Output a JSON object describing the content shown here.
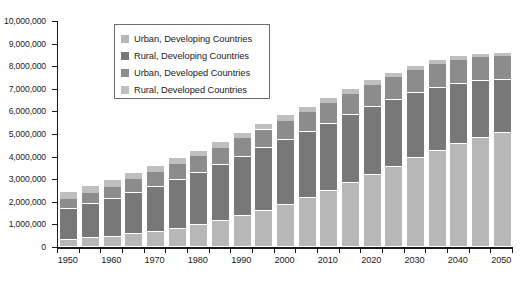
{
  "chart_data": {
    "type": "bar",
    "stacked": true,
    "title": "",
    "subtitle": "",
    "xlabel": "",
    "ylabel": "",
    "grid": false,
    "legend_position": "top-left-inside",
    "xlim": [
      "1950",
      "2050"
    ],
    "ylim": [
      0,
      10000000
    ],
    "ytick_step": 1000000,
    "categories": [
      "1950",
      "1955",
      "1960",
      "1965",
      "1970",
      "1975",
      "1980",
      "1985",
      "1990",
      "1995",
      "2000",
      "2005",
      "2010",
      "2015",
      "2020",
      "2025",
      "2030",
      "2035",
      "2040",
      "2045",
      "2050"
    ],
    "xtick_labels": [
      "1950",
      "1960",
      "1970",
      "1980",
      "1990",
      "2000",
      "2010",
      "2020",
      "2030",
      "2040",
      "2050"
    ],
    "ytick_labels": [
      "10,000,000",
      "9,000,000",
      "8,000,000",
      "7,000,000",
      "6,000,000",
      "5,000,000",
      "4,000,000",
      "3,000,000",
      "2,000,000",
      "1,000,000",
      "0"
    ],
    "series": [
      {
        "name": "Urban, Developing Countries",
        "color": "#b7b7b7",
        "values": [
          300000,
          380000,
          460000,
          570000,
          680000,
          810000,
          970000,
          1160000,
          1380000,
          1610000,
          1870000,
          2150000,
          2470000,
          2820000,
          3190000,
          3560000,
          3920000,
          4250000,
          4560000,
          4820000,
          5030000
        ]
      },
      {
        "name": "Rural, Developing Countries",
        "color": "#787878",
        "values": [
          1400000,
          1520000,
          1660000,
          1830000,
          1990000,
          2160000,
          2310000,
          2460000,
          2620000,
          2750000,
          2850000,
          2930000,
          2980000,
          3010000,
          3000000,
          2960000,
          2890000,
          2790000,
          2660000,
          2510000,
          2340000
        ]
      },
      {
        "name": "Urban, Developed Countries",
        "color": "#8c8c8c",
        "values": [
          440000,
          490000,
          540000,
          590000,
          640000,
          690000,
          730000,
          770000,
          810000,
          840000,
          870000,
          900000,
          930000,
          960000,
          990000,
          1010000,
          1030000,
          1050000,
          1060000,
          1070000,
          1080000
        ]
      },
      {
        "name": "Rural, Developed Countries",
        "color": "#bfbfbf",
        "values": [
          310000,
          300000,
          290000,
          280000,
          270000,
          260000,
          250000,
          245000,
          240000,
          235000,
          230000,
          225000,
          220000,
          210000,
          200000,
          190000,
          180000,
          170000,
          160000,
          150000,
          140000
        ]
      }
    ],
    "totals": [
      2450000,
      2690000,
      2950000,
      3270000,
      3580000,
      3920000,
      4260000,
      4635000,
      5050000,
      5435000,
      5820000,
      6205000,
      6600000,
      7000000,
      7380000,
      7720000,
      8020000,
      8260000,
      8440000,
      8550000,
      8590000
    ]
  },
  "legend": {
    "items": [
      {
        "label": "Urban, Developing Countries",
        "color": "#b7b7b7"
      },
      {
        "label": "Rural, Developing Countries",
        "color": "#787878"
      },
      {
        "label": "Urban, Developed Countries",
        "color": "#8c8c8c"
      },
      {
        "label": "Rural, Developed Countries",
        "color": "#bfbfbf"
      }
    ]
  },
  "axes": {
    "y_max": 10000000,
    "y_min": 0,
    "axis_color": "#1a1a1a"
  }
}
